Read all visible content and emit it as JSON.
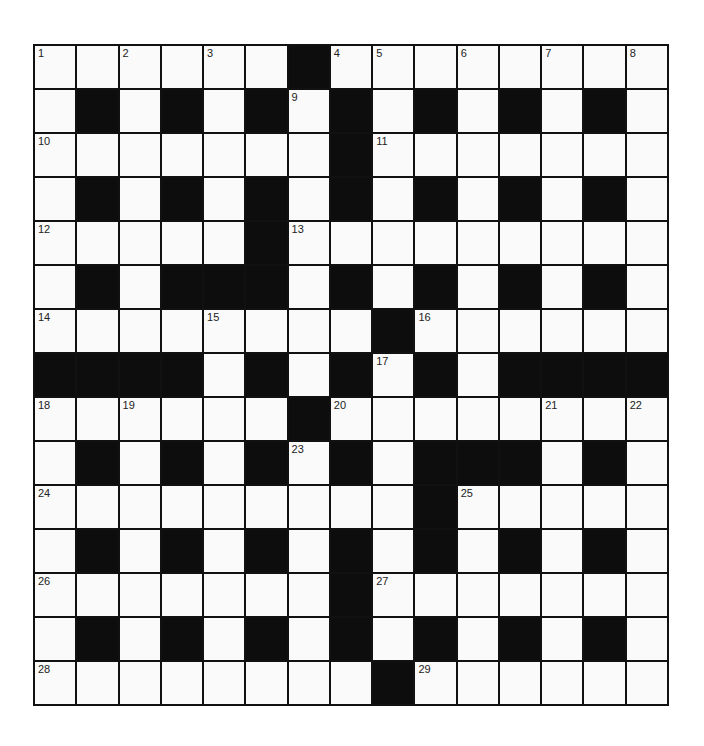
{
  "puzzle": {
    "rows": 15,
    "cols": 15,
    "colors": {
      "white": "#fafafa",
      "black": "#0d0d0d",
      "line": "#111111"
    },
    "layout": [
      "000000100000000",
      "010101010101010",
      "000000010000000",
      "010101010101010",
      "000001000000000",
      "010111010101010",
      "000000001000000",
      "111101010101111",
      "000000100000000",
      "010101010111010",
      "000000000100000",
      "010101010101010",
      "000000010000000",
      "010101010101010",
      "000000001000000"
    ],
    "numbers": [
      {
        "n": "1",
        "r": 0,
        "c": 0
      },
      {
        "n": "2",
        "r": 0,
        "c": 2
      },
      {
        "n": "3",
        "r": 0,
        "c": 4
      },
      {
        "n": "4",
        "r": 0,
        "c": 7
      },
      {
        "n": "5",
        "r": 0,
        "c": 8
      },
      {
        "n": "6",
        "r": 0,
        "c": 10
      },
      {
        "n": "7",
        "r": 0,
        "c": 12
      },
      {
        "n": "8",
        "r": 0,
        "c": 14
      },
      {
        "n": "9",
        "r": 1,
        "c": 6
      },
      {
        "n": "10",
        "r": 2,
        "c": 0
      },
      {
        "n": "11",
        "r": 2,
        "c": 8
      },
      {
        "n": "12",
        "r": 4,
        "c": 0
      },
      {
        "n": "13",
        "r": 4,
        "c": 6
      },
      {
        "n": "14",
        "r": 6,
        "c": 0
      },
      {
        "n": "15",
        "r": 6,
        "c": 4
      },
      {
        "n": "16",
        "r": 6,
        "c": 9
      },
      {
        "n": "17",
        "r": 7,
        "c": 8
      },
      {
        "n": "18",
        "r": 8,
        "c": 0
      },
      {
        "n": "19",
        "r": 8,
        "c": 2
      },
      {
        "n": "20",
        "r": 8,
        "c": 7
      },
      {
        "n": "21",
        "r": 8,
        "c": 12
      },
      {
        "n": "22",
        "r": 8,
        "c": 14
      },
      {
        "n": "23",
        "r": 9,
        "c": 6
      },
      {
        "n": "24",
        "r": 10,
        "c": 0
      },
      {
        "n": "25",
        "r": 10,
        "c": 10
      },
      {
        "n": "26",
        "r": 12,
        "c": 0
      },
      {
        "n": "27",
        "r": 12,
        "c": 8
      },
      {
        "n": "28",
        "r": 14,
        "c": 0
      },
      {
        "n": "29",
        "r": 14,
        "c": 9
      }
    ]
  }
}
